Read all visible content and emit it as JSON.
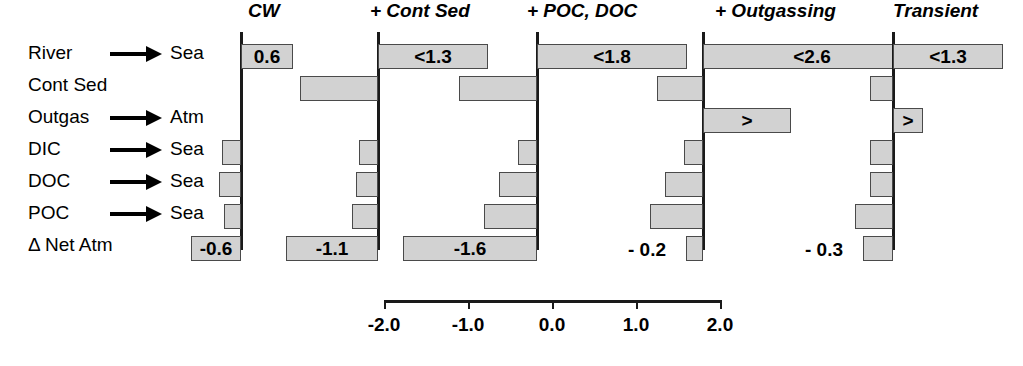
{
  "figure": {
    "scale_px_per_unit": 84,
    "bar_fill_color": "#d2d2d2",
    "bar_border_color": "#4a4a4a",
    "axis_color": "#1a1a1a"
  },
  "rows": [
    {
      "source": "River",
      "arrow": true,
      "dest": "Sea"
    },
    {
      "source": "Cont Sed",
      "arrow": false,
      "dest": ""
    },
    {
      "source": "Outgas",
      "arrow": true,
      "dest": "Atm"
    },
    {
      "source": "DIC",
      "arrow": true,
      "dest": "Sea"
    },
    {
      "source": "DOC",
      "arrow": true,
      "dest": "Sea"
    },
    {
      "source": "POC",
      "arrow": true,
      "dest": "Sea"
    },
    {
      "source": "Δ Net Atm",
      "arrow": false,
      "dest": ""
    }
  ],
  "chart_data": {
    "type": "bar",
    "title": "",
    "xlabel": "",
    "ylabel": "",
    "xlim": [
      -2.0,
      2.0
    ],
    "grid": false,
    "orientation": "horizontal",
    "categories": [
      "River → Sea",
      "Cont Sed",
      "Outgas → Atm",
      "DIC → Sea",
      "DOC → Sea",
      "POC → Sea",
      "Δ Net Atm"
    ],
    "axis": {
      "ticks": [
        -2.0,
        -1.0,
        0.0,
        1.0,
        2.0
      ],
      "ticklabels": [
        "-2.0",
        "-1.0",
        "0.0",
        "1.0",
        "2.0"
      ],
      "min": -2.0,
      "max": 2.0
    },
    "series": [
      {
        "name": "CW",
        "values": [
          0.6,
          -0.93,
          0.0,
          -0.22,
          -0.27,
          -0.2,
          -0.6
        ],
        "labels": [
          "0.6",
          "",
          "",
          "",
          "",
          "",
          "-0.6"
        ]
      },
      {
        "name": "+ Cont Sed",
        "values": [
          1.3,
          -0.93,
          0.0,
          -0.22,
          -0.27,
          -0.31,
          -1.1
        ],
        "labels": [
          "<1.3",
          "",
          "",
          "",
          "",
          "",
          "-1.1"
        ]
      },
      {
        "name": "+ POC, DOC",
        "values": [
          1.8,
          -0.93,
          0.0,
          -0.22,
          -0.45,
          -0.63,
          -1.6
        ],
        "labels": [
          "<1.8",
          "",
          "",
          "",
          "",
          "",
          "-1.6"
        ]
      },
      {
        "name": "+ Outgassing",
        "values": [
          2.6,
          -0.55,
          1.05,
          -0.22,
          -0.45,
          -0.63,
          -0.2
        ],
        "labels": [
          "<2.6",
          "",
          ">",
          "",
          "",
          "",
          "- 0.2"
        ]
      },
      {
        "name": "Transient",
        "values": [
          1.3,
          -0.27,
          0.35,
          -0.27,
          -0.27,
          -0.45,
          -0.3
        ],
        "labels": [
          "<1.3",
          "",
          ">",
          "",
          "",
          "",
          "- 0.3"
        ]
      }
    ]
  },
  "panels": [
    {
      "title": "CW",
      "title_left": 248,
      "zero_x": 241,
      "bars": [
        {
          "row": 0,
          "left": 241,
          "width": 52,
          "label": "0.6",
          "label_pos": "c",
          "outside": false
        },
        {
          "row": 1,
          "left": 0,
          "width": 0,
          "label": "",
          "label_pos": "c",
          "outside": false
        },
        {
          "row": 2,
          "left": 0,
          "width": 0,
          "label": "",
          "label_pos": "c",
          "outside": false
        },
        {
          "row": 3,
          "left": 222,
          "width": 19,
          "label": "",
          "label_pos": "c",
          "outside": false
        },
        {
          "row": 4,
          "left": 219,
          "width": 22,
          "label": "",
          "label_pos": "c",
          "outside": false
        },
        {
          "row": 5,
          "left": 224,
          "width": 17,
          "label": "",
          "label_pos": "c",
          "outside": false
        },
        {
          "row": 6,
          "left": 191,
          "width": 50,
          "label": "-0.6",
          "label_pos": "c",
          "outside": false
        }
      ]
    },
    {
      "title": "+ Cont Sed",
      "title_left": 370,
      "zero_x": 378,
      "bars": [
        {
          "row": 0,
          "left": 378,
          "width": 110,
          "label": "<1.3",
          "label_pos": "c",
          "outside": false
        },
        {
          "row": 1,
          "left": 300,
          "width": 78,
          "label": "",
          "label_pos": "c",
          "outside": false
        },
        {
          "row": 2,
          "left": 0,
          "width": 0,
          "label": "",
          "label_pos": "c",
          "outside": false
        },
        {
          "row": 3,
          "left": 359,
          "width": 19,
          "label": "",
          "label_pos": "c",
          "outside": false
        },
        {
          "row": 4,
          "left": 356,
          "width": 22,
          "label": "",
          "label_pos": "c",
          "outside": false
        },
        {
          "row": 5,
          "left": 352,
          "width": 26,
          "label": "",
          "label_pos": "c",
          "outside": false
        },
        {
          "row": 6,
          "left": 286,
          "width": 92,
          "label": "-1.1",
          "label_pos": "c",
          "outside": false
        }
      ]
    },
    {
      "title": "+ POC, DOC",
      "title_left": 527,
      "zero_x": 537,
      "bars": [
        {
          "row": 0,
          "left": 537,
          "width": 150,
          "label": "<1.8",
          "label_pos": "c",
          "outside": false
        },
        {
          "row": 1,
          "left": 459,
          "width": 78,
          "label": "",
          "label_pos": "c",
          "outside": false
        },
        {
          "row": 2,
          "left": 0,
          "width": 0,
          "label": "",
          "label_pos": "c",
          "outside": false
        },
        {
          "row": 3,
          "left": 518,
          "width": 19,
          "label": "",
          "label_pos": "c",
          "outside": false
        },
        {
          "row": 4,
          "left": 499,
          "width": 38,
          "label": "",
          "label_pos": "c",
          "outside": false
        },
        {
          "row": 5,
          "left": 484,
          "width": 53,
          "label": "",
          "label_pos": "c",
          "outside": false
        },
        {
          "row": 6,
          "left": 403,
          "width": 134,
          "label": "-1.6",
          "label_pos": "c",
          "outside": false
        }
      ]
    },
    {
      "title": "+ Outgassing",
      "title_left": 715,
      "zero_x": 703,
      "bars": [
        {
          "row": 0,
          "left": 703,
          "width": 218,
          "label": "<2.6",
          "label_pos": "c",
          "outside": false
        },
        {
          "row": 1,
          "left": 657,
          "width": 46,
          "label": "",
          "label_pos": "c",
          "outside": false
        },
        {
          "row": 2,
          "left": 703,
          "width": 88,
          "label": ">",
          "label_pos": "c",
          "outside": false
        },
        {
          "row": 3,
          "left": 684,
          "width": 19,
          "label": "",
          "label_pos": "c",
          "outside": false
        },
        {
          "row": 4,
          "left": 665,
          "width": 38,
          "label": "",
          "label_pos": "c",
          "outside": false
        },
        {
          "row": 5,
          "left": 650,
          "width": 53,
          "label": "",
          "label_pos": "c",
          "outside": false
        },
        {
          "row": 6,
          "left": 686,
          "width": 17,
          "label": "- 0.2",
          "label_pos": "out-left",
          "outside": true
        }
      ]
    },
    {
      "title": "Transient",
      "title_left": 893,
      "zero_x": 893,
      "bars": [
        {
          "row": 0,
          "left": 893,
          "width": 110,
          "label": "<1.3",
          "label_pos": "c",
          "outside": false
        },
        {
          "row": 1,
          "left": 870,
          "width": 23,
          "label": "",
          "label_pos": "c",
          "outside": false
        },
        {
          "row": 2,
          "left": 893,
          "width": 30,
          "label": ">",
          "label_pos": "c",
          "outside": false
        },
        {
          "row": 3,
          "left": 870,
          "width": 23,
          "label": "",
          "label_pos": "c",
          "outside": false
        },
        {
          "row": 4,
          "left": 870,
          "width": 23,
          "label": "",
          "label_pos": "c",
          "outside": false
        },
        {
          "row": 5,
          "left": 855,
          "width": 38,
          "label": "",
          "label_pos": "c",
          "outside": false
        },
        {
          "row": 6,
          "left": 863,
          "width": 30,
          "label": "- 0.3",
          "label_pos": "out-left",
          "outside": true
        }
      ]
    }
  ],
  "axis": {
    "left": 384,
    "top": 300,
    "width": 336,
    "ticks": [
      {
        "value": "-2.0",
        "x": 0
      },
      {
        "value": "-1.0",
        "x": 84
      },
      {
        "value": "0.0",
        "x": 168
      },
      {
        "value": "1.0",
        "x": 252
      },
      {
        "value": "2.0",
        "x": 336
      }
    ]
  }
}
